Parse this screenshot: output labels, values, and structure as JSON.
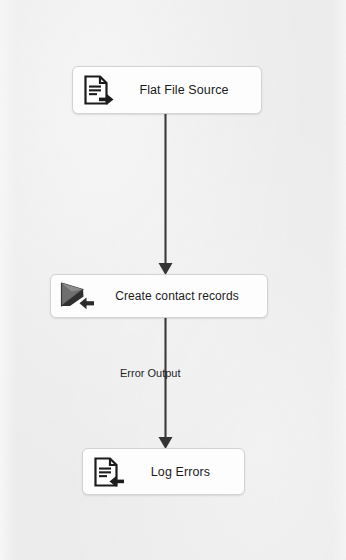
{
  "diagram": {
    "type": "data-flow",
    "background_color": "#ededed",
    "node_fill_color": "#fdfdfd",
    "node_border_color": "#d2d2d2",
    "connector_color": "#3a3a3a",
    "text_color": "#1b1b1b",
    "nodes": [
      {
        "id": "flat-file-source",
        "label": "Flat File Source",
        "icon": "document-arrow-right-icon",
        "x": 72,
        "y": 66,
        "width": 190,
        "height": 48
      },
      {
        "id": "create-contact-records",
        "label": "Create contact records",
        "icon": "script-component-arrow-left-icon",
        "x": 50,
        "y": 274,
        "width": 218,
        "height": 44
      },
      {
        "id": "log-errors",
        "label": "Log Errors",
        "icon": "document-arrow-left-icon",
        "x": 82,
        "y": 448,
        "width": 163,
        "height": 47
      }
    ],
    "connectors": [
      {
        "id": "flat-file-to-create",
        "from": "flat-file-source",
        "to": "create-contact-records",
        "label": "",
        "arrowhead": "solid-triangle-down"
      },
      {
        "id": "create-to-log-errors",
        "from": "create-contact-records",
        "to": "log-errors",
        "label": "Error Output",
        "arrowhead": "solid-triangle-down"
      }
    ]
  }
}
